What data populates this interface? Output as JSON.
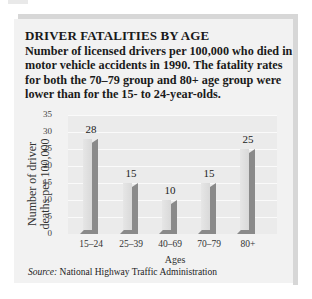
{
  "header": {
    "title": "DRIVER FATALITIES BY AGE",
    "subtitle": "Number of licensed drivers per 100,000 who died in motor vehicle accidents in 1990. The fatality rates for both the 70–79 group and 80+ age group were lower than for the 15- to 24-year-olds."
  },
  "axes": {
    "ylabel": "Number of driver deaths per 100,000",
    "xlabel": "Ages",
    "yticks": [
      "35",
      "30",
      "25",
      "20",
      "15",
      "10",
      "5",
      "0"
    ]
  },
  "bars": [
    {
      "category": "15–24",
      "value": "28"
    },
    {
      "category": "25–39",
      "value": "15"
    },
    {
      "category": "40–69",
      "value": "10"
    },
    {
      "category": "70–79",
      "value": "15"
    },
    {
      "category": "80+",
      "value": "25"
    }
  ],
  "footer": {
    "source_label": "Source:",
    "source_text": " National Highway Traffic Administration"
  },
  "colors": {
    "card_background": "#f2f2f2",
    "plot_background": "#ebebeb",
    "bar_front": "#e0e0e0",
    "bar_side": "#8a8a8a",
    "shadow": "#d7d7d7"
  },
  "chart_data": {
    "type": "bar",
    "title": "DRIVER FATALITIES BY AGE",
    "subtitle": "Number of licensed drivers per 100,000 who died in motor vehicle accidents in 1990. The fatality rates for both the 70–79 group and 80+ age group were lower than for the 15- to 24-year-olds.",
    "categories": [
      "15–24",
      "25–39",
      "40–69",
      "70–79",
      "80+"
    ],
    "values": [
      28,
      15,
      10,
      15,
      25
    ],
    "xlabel": "Ages",
    "ylabel": "Number of driver deaths per 100,000",
    "ylim": [
      0,
      35
    ],
    "yticks": [
      0,
      5,
      10,
      15,
      20,
      25,
      30,
      35
    ],
    "grid": true,
    "legend": null,
    "data_labels": true,
    "style": "3d-bar",
    "source": "Source: National Highway Traffic Administration"
  }
}
